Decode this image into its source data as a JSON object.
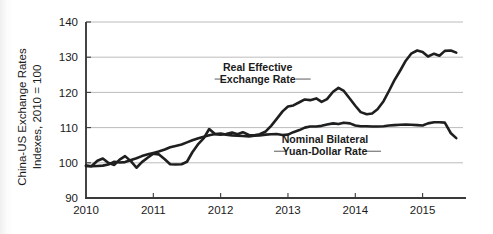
{
  "chart_data": {
    "type": "line",
    "title": "",
    "subtitle": "",
    "xlabel": "",
    "ylabel": "China-US Exchange Rates",
    "ylabel_line2": "Indexes, 2010 = 100",
    "ylim": [
      90,
      140
    ],
    "xlim": [
      2010.0,
      2015.6
    ],
    "yticks": [
      90,
      100,
      110,
      120,
      130,
      140
    ],
    "ytick_labels": [
      "90",
      "100",
      "110",
      "120",
      "130",
      "140"
    ],
    "xticks": [
      2010,
      2011,
      2012,
      2013,
      2014,
      2015
    ],
    "xtick_labels": [
      "2010",
      "2011",
      "2012",
      "2013",
      "2014",
      "2015"
    ],
    "grid": "horizontal",
    "legend_position": "inline-annotations",
    "line_color": "#1f1f1f",
    "grid_color": "#b4b4b4",
    "annotations": [
      {
        "text_line1": "Real Effective",
        "text_line2": "Exchange Rate",
        "x": 2012.55,
        "y": 124.5
      },
      {
        "text_line1": "Nominal Bilateral",
        "text_line2": "Yuan-Dollar Rate",
        "x": 2013.55,
        "y": 104.0
      }
    ],
    "series": [
      {
        "name": "Real Effective Exchange Rate",
        "x": [
          2010.0,
          2010.08,
          2010.17,
          2010.25,
          2010.33,
          2010.42,
          2010.5,
          2010.58,
          2010.67,
          2010.75,
          2010.83,
          2010.92,
          2011.0,
          2011.08,
          2011.17,
          2011.25,
          2011.33,
          2011.42,
          2011.5,
          2011.58,
          2011.67,
          2011.75,
          2011.83,
          2011.92,
          2012.0,
          2012.08,
          2012.17,
          2012.25,
          2012.33,
          2012.42,
          2012.5,
          2012.58,
          2012.67,
          2012.75,
          2012.83,
          2012.92,
          2013.0,
          2013.08,
          2013.17,
          2013.25,
          2013.33,
          2013.42,
          2013.5,
          2013.58,
          2013.67,
          2013.75,
          2013.83,
          2013.92,
          2014.0,
          2014.08,
          2014.17,
          2014.25,
          2014.33,
          2014.42,
          2014.5,
          2014.58,
          2014.67,
          2014.75,
          2014.83,
          2014.92,
          2015.0,
          2015.08,
          2015.17,
          2015.25,
          2015.33,
          2015.42,
          2015.5
        ],
        "y": [
          99.2,
          99.0,
          100.6,
          101.2,
          100.0,
          99.4,
          100.9,
          101.9,
          100.4,
          98.6,
          100.2,
          101.5,
          102.6,
          102.4,
          101.0,
          99.6,
          99.5,
          99.6,
          100.3,
          103.0,
          105.4,
          107.0,
          109.6,
          108.1,
          108.0,
          108.2,
          108.6,
          108.1,
          108.7,
          107.9,
          107.8,
          108.1,
          108.9,
          110.5,
          112.4,
          114.6,
          116.0,
          116.3,
          117.2,
          118.0,
          117.8,
          118.3,
          117.3,
          118.1,
          120.2,
          121.3,
          120.4,
          118.2,
          116.2,
          114.4,
          113.8,
          114.0,
          115.2,
          117.5,
          120.4,
          123.4,
          126.3,
          129.0,
          131.0,
          131.9,
          131.5,
          130.2,
          131.0,
          130.4,
          131.8,
          131.9,
          131.3
        ]
      },
      {
        "name": "Nominal Bilateral Yuan-Dollar Rate",
        "x": [
          2010.0,
          2010.08,
          2010.17,
          2010.25,
          2010.33,
          2010.42,
          2010.5,
          2010.58,
          2010.67,
          2010.75,
          2010.83,
          2010.92,
          2011.0,
          2011.08,
          2011.17,
          2011.25,
          2011.33,
          2011.42,
          2011.5,
          2011.58,
          2011.67,
          2011.75,
          2011.83,
          2011.92,
          2012.0,
          2012.08,
          2012.17,
          2012.25,
          2012.33,
          2012.42,
          2012.5,
          2012.58,
          2012.67,
          2012.75,
          2012.83,
          2012.92,
          2013.0,
          2013.08,
          2013.17,
          2013.25,
          2013.33,
          2013.42,
          2013.5,
          2013.58,
          2013.67,
          2013.75,
          2013.83,
          2013.92,
          2014.0,
          2014.08,
          2014.17,
          2014.25,
          2014.33,
          2014.42,
          2014.5,
          2014.58,
          2014.67,
          2014.75,
          2014.83,
          2014.92,
          2015.0,
          2015.08,
          2015.17,
          2015.25,
          2015.33,
          2015.42,
          2015.5
        ],
        "y": [
          99.1,
          99.0,
          99.1,
          99.2,
          99.5,
          100.3,
          100.1,
          100.2,
          100.8,
          101.3,
          101.9,
          102.4,
          102.8,
          103.2,
          103.8,
          104.4,
          104.8,
          105.2,
          105.8,
          106.4,
          107.0,
          107.4,
          107.8,
          108.2,
          108.3,
          108.0,
          107.8,
          107.7,
          107.6,
          107.5,
          107.7,
          107.8,
          108.0,
          108.1,
          108.2,
          107.9,
          108.0,
          108.7,
          109.3,
          110.0,
          110.3,
          110.3,
          110.5,
          110.9,
          111.2,
          111.0,
          111.4,
          111.2,
          110.6,
          110.4,
          110.4,
          110.3,
          110.3,
          110.4,
          110.6,
          110.7,
          110.8,
          110.9,
          110.8,
          110.7,
          110.6,
          111.2,
          111.5,
          111.5,
          111.4,
          108.4,
          107.0
        ]
      }
    ]
  }
}
